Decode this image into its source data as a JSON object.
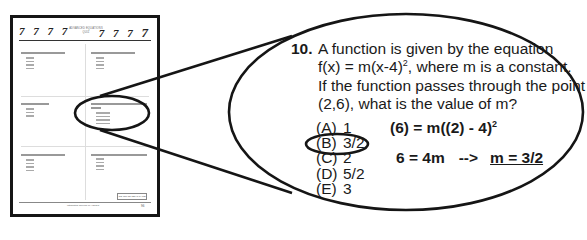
{
  "thumbnail": {
    "header_sevens_left": "7 7 7 7",
    "header_sevens_right_prefix": "7 7 7 ",
    "header_sevens_right_last": "7",
    "header_title_line1": "ADVANCED EQUATIONS",
    "header_title_line2": "QUIZ",
    "go_on_label": "GO ON TO NEXT PAGE",
    "footer_text": "Integrated Review of Algebra",
    "page_number": "96"
  },
  "question": {
    "number": "10.",
    "lines": [
      "A function is given by the equation",
      "f(x) = m(x-4)",
      ", where m is a constant.",
      "If the function passes through the point",
      "(2,6), what is the value of m?"
    ],
    "exponent": "2"
  },
  "choices": [
    {
      "letter": "(A)",
      "value": "1",
      "selected": false
    },
    {
      "letter": "(B)",
      "value": "3/2",
      "selected": true
    },
    {
      "letter": "(C)",
      "value": "2",
      "selected": false
    },
    {
      "letter": "(D)",
      "value": "5/2",
      "selected": false
    },
    {
      "letter": "(E)",
      "value": "3",
      "selected": false
    }
  ],
  "work": {
    "line1": "(6) = m((2) - 4)",
    "line1_exp": "2",
    "line2_left": "6 = 4m",
    "line2_arrow": "-->",
    "line2_answer": "m = 3/2"
  },
  "colors": {
    "ink": "#1a1a1a",
    "background": "#ffffff"
  }
}
